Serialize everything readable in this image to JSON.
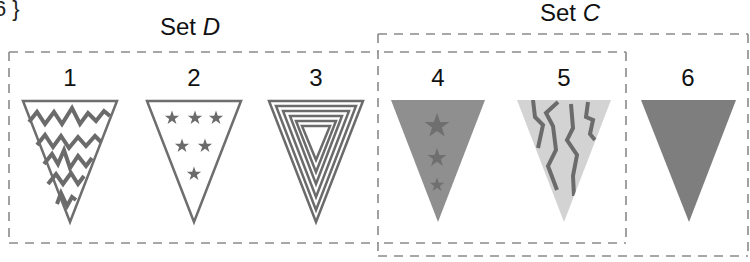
{
  "header": {
    "cut_text": "6 }"
  },
  "sets": {
    "D": {
      "label_prefix": "Set ",
      "label_var": "D",
      "members": [
        1,
        2,
        3,
        4,
        5
      ]
    },
    "C": {
      "label_prefix": "Set ",
      "label_var": "C",
      "members": [
        4,
        5,
        6
      ]
    }
  },
  "flags": [
    {
      "number": "1",
      "pattern": "zigzag-stripes",
      "fill": "#ffffff",
      "stroke": "#6e6e6e"
    },
    {
      "number": "2",
      "pattern": "six-stars",
      "fill": "#ffffff",
      "stroke": "#6e6e6e"
    },
    {
      "number": "3",
      "pattern": "concentric-triangles",
      "fill": "#ffffff",
      "stroke": "#6e6e6e"
    },
    {
      "number": "4",
      "pattern": "three-stars-solid",
      "fill": "#8f8f8f",
      "stroke": "#7a7a7a"
    },
    {
      "number": "5",
      "pattern": "wavy-lines",
      "fill": "#d3d3d3",
      "stroke": "#6e6e6e"
    },
    {
      "number": "6",
      "pattern": "solid",
      "fill": "#7e7e7e",
      "stroke": "#7e7e7e"
    }
  ],
  "colors": {
    "dash": "#8a8a8a",
    "pattern": "#6b6b6b"
  }
}
